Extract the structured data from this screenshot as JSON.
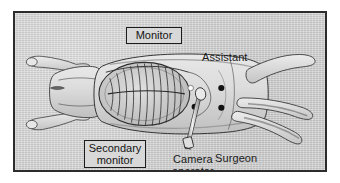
{
  "figure": {
    "type": "operating-room-setup-illustration",
    "frame_color": "#2c2c2c",
    "background_color": "#d2d2d2",
    "labels": {
      "monitor": "Monitor",
      "secondary_monitor": "Secondary\nmonitor",
      "assistant": "Assistant",
      "surgeon": "Surgeon",
      "camera_operator": "Camera\noperator"
    },
    "anatomy": {
      "rib_cage": "rib-cage",
      "forelimbs": 2,
      "hindlimbs": 2,
      "snout": "snout"
    },
    "instruments": {
      "laparoscope": "laparoscope-camera",
      "port_sites": 4,
      "highlight_port": 1
    }
  }
}
